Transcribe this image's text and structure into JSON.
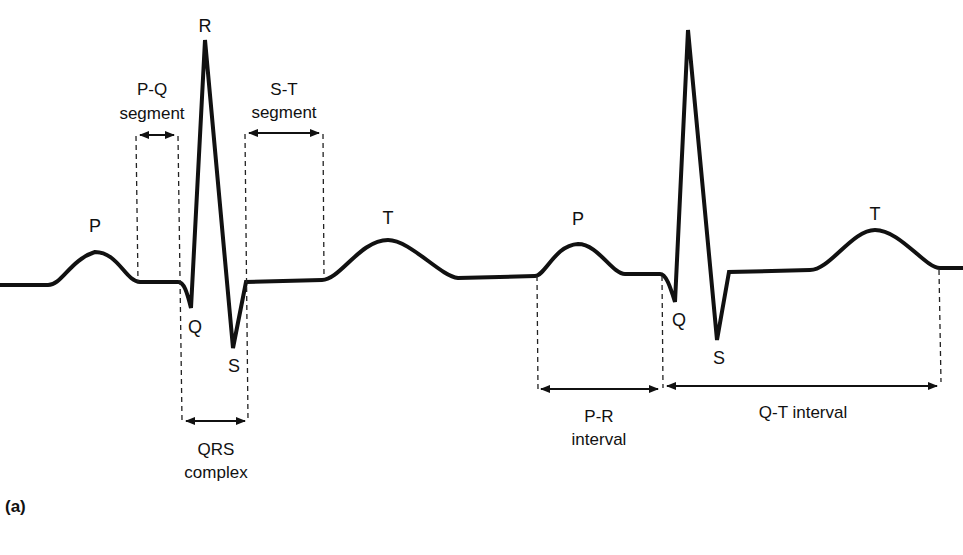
{
  "diagram": {
    "panel_label": "(a)",
    "colors": {
      "trace": "#111111",
      "guide": "#222222",
      "background": "#ffffff"
    },
    "wave_labels": {
      "beat1": {
        "P": "P",
        "Q": "Q",
        "R": "R",
        "S": "S",
        "T": "T"
      },
      "beat2": {
        "P": "P",
        "Q": "Q",
        "S": "S",
        "T": "T"
      }
    },
    "annotations": {
      "pq_segment": {
        "line1": "P-Q",
        "line2": "segment"
      },
      "st_segment": {
        "line1": "S-T",
        "line2": "segment"
      },
      "qrs_complex": {
        "line1": "QRS",
        "line2": "complex"
      },
      "pr_interval": {
        "line1": "P-R",
        "line2": "interval"
      },
      "qt_interval": {
        "line1": "Q-T interval"
      }
    }
  }
}
